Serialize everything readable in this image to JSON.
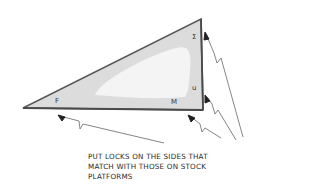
{
  "diagram": {
    "shape": "right-triangle",
    "fill_color": "#d9d9d9",
    "highlight_color": "#f2f2f2",
    "stroke_color": "#555555",
    "vertex_labels": {
      "left_bottom": "F",
      "right_bottom": "M",
      "right_top": "Σ",
      "right_middle": "u"
    },
    "arrows": [
      {
        "target": "bottom-side-left",
        "pointing_to": "F"
      },
      {
        "target": "bottom-right-corner",
        "pointing_to": "M"
      },
      {
        "target": "right-side-top",
        "pointing_to": "Σ"
      },
      {
        "target": "right-side-lower",
        "pointing_to": "u"
      }
    ],
    "note": {
      "lines": [
        "PUT LOCKS ON THE SIDES THAT",
        "MATCH WITH THOSE ON STOCK",
        "PLATFORMS"
      ]
    }
  }
}
